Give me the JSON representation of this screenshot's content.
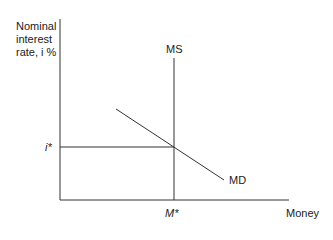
{
  "diagram": {
    "y_axis_label_lines": [
      "Nominal",
      "interest",
      "rate, i %"
    ],
    "x_axis_label": "Money",
    "supply_label": "MS",
    "demand_label": "MD",
    "equilibrium_rate_label": "i*",
    "equilibrium_quantity_label": "M*",
    "line_color": "#333333"
  }
}
